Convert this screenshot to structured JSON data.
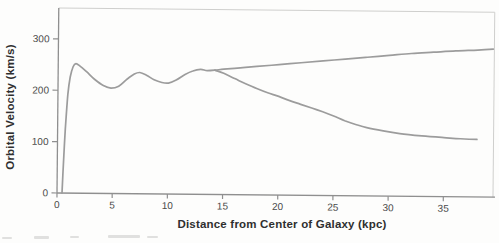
{
  "chart_data": {
    "type": "line",
    "title": "",
    "xlabel": "Distance from Center of Galaxy (kpc)",
    "ylabel": "Orbital Velocity (km/s)",
    "xlim": [
      0,
      39.5
    ],
    "ylim": [
      0,
      360
    ],
    "x_ticks": [
      0,
      5,
      10,
      15,
      20,
      25,
      30,
      35
    ],
    "y_ticks": [
      0,
      100,
      200,
      300
    ],
    "grid": false,
    "legend_position": "none",
    "series": [
      {
        "name": "observed_flat_rotation_curve",
        "points": [
          [
            0.45,
            0
          ],
          [
            0.55,
            55
          ],
          [
            0.7,
            125
          ],
          [
            0.9,
            192
          ],
          [
            1.1,
            226
          ],
          [
            1.35,
            246
          ],
          [
            1.6,
            252
          ],
          [
            2.0,
            247
          ],
          [
            2.6,
            236
          ],
          [
            3.3,
            222
          ],
          [
            4.1,
            210
          ],
          [
            4.8,
            205
          ],
          [
            5.5,
            209
          ],
          [
            6.2,
            222
          ],
          [
            6.9,
            233
          ],
          [
            7.4,
            236
          ],
          [
            8.0,
            231
          ],
          [
            8.7,
            222
          ],
          [
            9.4,
            217
          ],
          [
            10.0,
            216
          ],
          [
            10.7,
            222
          ],
          [
            11.5,
            233
          ],
          [
            12.2,
            240
          ],
          [
            12.9,
            243
          ],
          [
            13.5,
            241
          ],
          [
            14.2,
            242
          ],
          [
            15.0,
            244
          ],
          [
            16.5,
            247
          ],
          [
            18,
            250
          ],
          [
            20,
            254
          ],
          [
            22,
            258
          ],
          [
            24,
            262
          ],
          [
            26,
            266
          ],
          [
            28,
            270
          ],
          [
            30,
            274
          ],
          [
            32,
            278
          ],
          [
            34,
            281
          ],
          [
            36,
            284
          ],
          [
            38,
            286
          ],
          [
            39.4,
            288
          ]
        ]
      },
      {
        "name": "keplerian_expected_decline",
        "points": [
          [
            14.2,
            242
          ],
          [
            15,
            236
          ],
          [
            16,
            226
          ],
          [
            17,
            216
          ],
          [
            18,
            207
          ],
          [
            19,
            199
          ],
          [
            20,
            192
          ],
          [
            21,
            184
          ],
          [
            22,
            177
          ],
          [
            23,
            170
          ],
          [
            24,
            163
          ],
          [
            25,
            155
          ],
          [
            26,
            146
          ],
          [
            27,
            139
          ],
          [
            28,
            133
          ],
          [
            29.5,
            127
          ],
          [
            31,
            122
          ],
          [
            33,
            118
          ],
          [
            35,
            115
          ],
          [
            36.5,
            113
          ],
          [
            38,
            112
          ]
        ]
      }
    ]
  },
  "colors": {
    "curve": "#9c9c9c",
    "axis": "#8f8f8f",
    "frame": "#cfcfcd",
    "tick_text": "#4a4a4a",
    "label_text": "#2f2f2f",
    "background": "#fdfdfc",
    "smudge": "#c9c9c6"
  }
}
